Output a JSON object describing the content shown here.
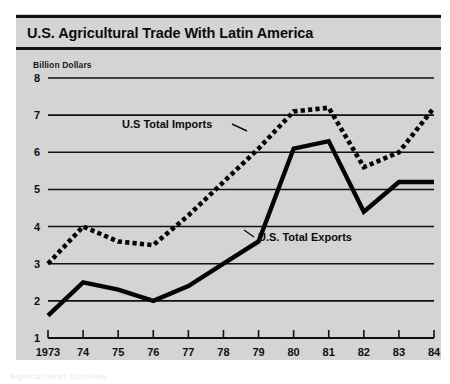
{
  "figure": {
    "title": "U.S. Agricultural Trade With Latin America",
    "unit_caption": "Billion Dollars",
    "panel_color": "#d4d4d4",
    "ink_color": "#111111",
    "page_artifact": "Agricultural Outlook"
  },
  "chart_data": {
    "type": "line",
    "title": "U.S. Agricultural Trade With Latin America",
    "subtitle": "",
    "xlabel": "",
    "ylabel": "Billion Dollars",
    "x": [
      1973,
      1974,
      1975,
      1976,
      1977,
      1978,
      1979,
      1980,
      1981,
      1982,
      1983,
      1984
    ],
    "tick_labels_x": [
      "1973",
      "74",
      "75",
      "76",
      "77",
      "78",
      "79",
      "80",
      "81",
      "82",
      "83",
      "84"
    ],
    "tick_labels_y": [
      "1",
      "2",
      "3",
      "4",
      "5",
      "6",
      "7",
      "8"
    ],
    "ylim": [
      1,
      8
    ],
    "xlim": [
      1973,
      1984
    ],
    "grid": true,
    "grid_axis": "y",
    "legend_position": "inline-annotation",
    "series": [
      {
        "name": "U.S Total Imports",
        "style": "dotted",
        "values": [
          3.0,
          4.0,
          3.6,
          3.5,
          4.3,
          5.2,
          6.1,
          7.1,
          7.2,
          5.6,
          6.0,
          7.2
        ]
      },
      {
        "name": "U.S. Total Exports",
        "style": "solid",
        "values": [
          1.6,
          2.5,
          2.3,
          2.0,
          2.4,
          3.0,
          3.6,
          6.1,
          6.3,
          4.4,
          5.2,
          5.2
        ]
      }
    ],
    "annotations": [
      {
        "text": "U.S Total Imports",
        "series": "U.S Total Imports",
        "anchor_year": 1977
      },
      {
        "text": "U.S. Total Exports",
        "series": "U.S. Total Exports",
        "anchor_year": 1979
      }
    ]
  }
}
